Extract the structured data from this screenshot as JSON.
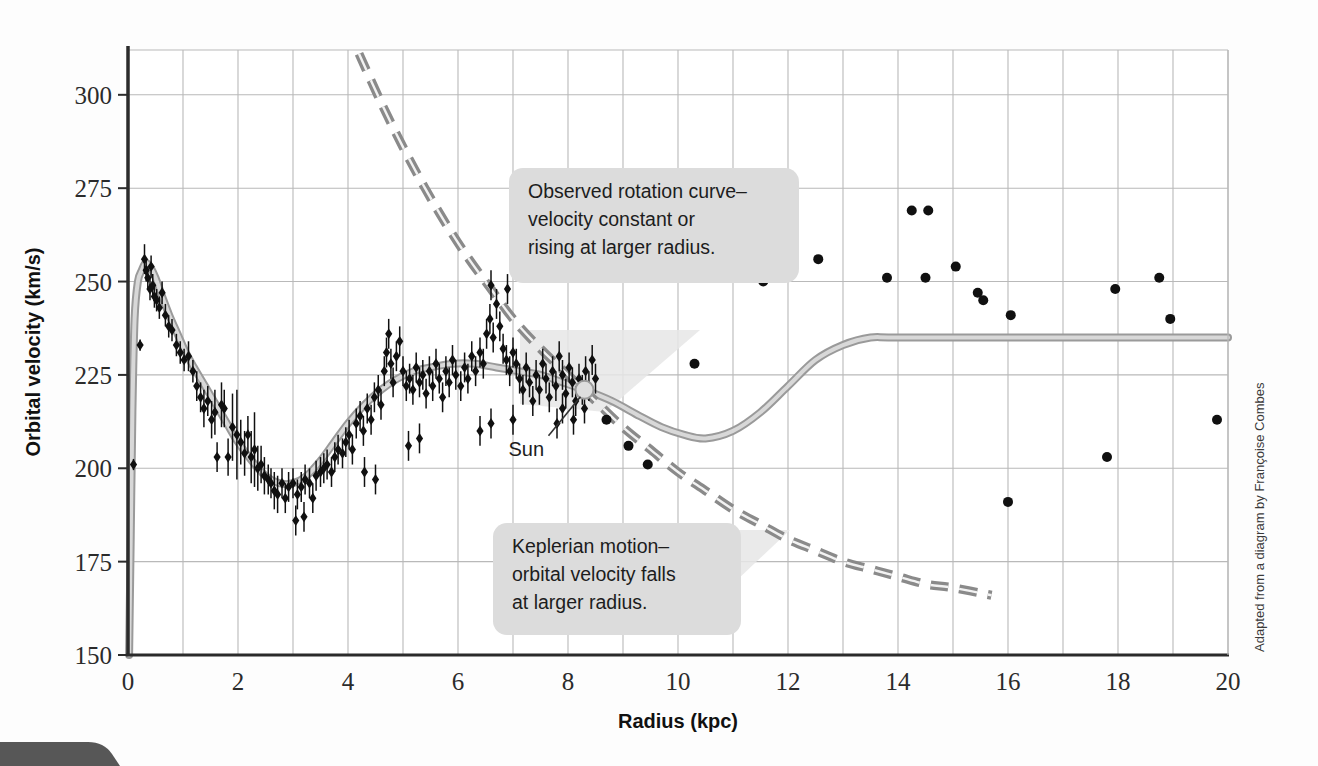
{
  "figure": {
    "credit": "Adapted from a diagram by Françoise Combes",
    "background_color": "#fdfdfd"
  },
  "colors": {
    "grid": "#b9b9b9",
    "axis": "#2b2b2b",
    "model_curve": "#9a9a9a",
    "model_curve_core": "#d8d8d8",
    "dashed_curve": "#8a8a8a",
    "data_point": "#101010",
    "callout_bg": "#dcdcdc",
    "callout_shadow": "#e3e3e3",
    "sun_marker": "#d9d9d9"
  },
  "annotations": {
    "observed": {
      "name": "observed-rotation-callout",
      "lines": [
        "Observed rotation curve–",
        "velocity constant or",
        "rising at larger radius."
      ]
    },
    "keplerian": {
      "name": "keplerian-callout",
      "lines": [
        "Keplerian motion–",
        "orbital velocity falls",
        "at larger radius."
      ]
    },
    "sun": {
      "label": "Sun",
      "radius_kpc": 8.3,
      "velocity_kms": 221
    }
  },
  "chart_data": {
    "type": "scatter",
    "title": "",
    "xlabel": "Radius (kpc)",
    "ylabel": "Orbital velocity (km/s)",
    "xlim": [
      0,
      20
    ],
    "ylim": [
      150,
      312
    ],
    "xticks": [
      0,
      2,
      4,
      6,
      8,
      10,
      12,
      14,
      16,
      18,
      20
    ],
    "yticks": [
      150,
      175,
      200,
      225,
      250,
      275,
      300
    ],
    "xtick_labels": [
      "0",
      "2",
      "4",
      "6",
      "8",
      "10",
      "12",
      "14",
      "16",
      "18",
      "20"
    ],
    "ytick_labels": [
      "150",
      "175",
      "200",
      "225",
      "250",
      "275",
      "300"
    ],
    "x_minor_step": 1,
    "grid": true,
    "legend": "none",
    "series": [
      {
        "name": "Model rotation curve (observed fit)",
        "type": "line",
        "style": "solid-gray-band",
        "points": [
          [
            0.02,
            150
          ],
          [
            0.05,
            182
          ],
          [
            0.08,
            215
          ],
          [
            0.12,
            240
          ],
          [
            0.18,
            250
          ],
          [
            0.25,
            253
          ],
          [
            0.32,
            255
          ],
          [
            0.4,
            254
          ],
          [
            0.5,
            251
          ],
          [
            0.62,
            246
          ],
          [
            0.75,
            241
          ],
          [
            0.9,
            236
          ],
          [
            1.05,
            231
          ],
          [
            1.2,
            227
          ],
          [
            1.4,
            222
          ],
          [
            1.6,
            217
          ],
          [
            1.8,
            212
          ],
          [
            2.0,
            207
          ],
          [
            2.25,
            202
          ],
          [
            2.5,
            198
          ],
          [
            2.75,
            196
          ],
          [
            3.0,
            196
          ],
          [
            3.25,
            198
          ],
          [
            3.5,
            202
          ],
          [
            3.75,
            207
          ],
          [
            4.0,
            212
          ],
          [
            4.3,
            217
          ],
          [
            4.6,
            221
          ],
          [
            4.9,
            224
          ],
          [
            5.2,
            226
          ],
          [
            5.5,
            227
          ],
          [
            5.9,
            228
          ],
          [
            6.3,
            228
          ],
          [
            6.7,
            227
          ],
          [
            7.1,
            226
          ],
          [
            7.5,
            225
          ],
          [
            7.9,
            223
          ],
          [
            8.3,
            221
          ],
          [
            8.8,
            218
          ],
          [
            9.3,
            214
          ],
          [
            9.7,
            211
          ],
          [
            10.1,
            209
          ],
          [
            10.5,
            208
          ],
          [
            11.0,
            210
          ],
          [
            11.5,
            215
          ],
          [
            12.0,
            222
          ],
          [
            12.5,
            229
          ],
          [
            13.0,
            233
          ],
          [
            13.5,
            235
          ],
          [
            14.0,
            235
          ],
          [
            16.0,
            235
          ],
          [
            18.0,
            235
          ],
          [
            20.0,
            235
          ]
        ]
      },
      {
        "name": "Keplerian prediction",
        "type": "line",
        "style": "dashed-gray",
        "points": [
          [
            4.2,
            311
          ],
          [
            4.6,
            298
          ],
          [
            5.0,
            286
          ],
          [
            5.4,
            275
          ],
          [
            5.8,
            265
          ],
          [
            6.2,
            256
          ],
          [
            6.6,
            248
          ],
          [
            7.0,
            240
          ],
          [
            7.5,
            232
          ],
          [
            8.0,
            225
          ],
          [
            8.5,
            218
          ],
          [
            9.0,
            211
          ],
          [
            9.5,
            205
          ],
          [
            10.0,
            199
          ],
          [
            10.5,
            194
          ],
          [
            11.0,
            189
          ],
          [
            11.5,
            185
          ],
          [
            12.0,
            181
          ],
          [
            12.5,
            178
          ],
          [
            13.0,
            175
          ],
          [
            13.5,
            173
          ],
          [
            14.0,
            171
          ],
          [
            14.5,
            169
          ],
          [
            15.0,
            168
          ],
          [
            15.7,
            166
          ]
        ]
      },
      {
        "name": "Inner disk measurements (with error bars)",
        "type": "scatter-errorbar",
        "marker": "diamond",
        "points": [
          [
            0.1,
            201,
            1.5
          ],
          [
            0.22,
            233,
            1.5
          ],
          [
            0.3,
            256,
            4
          ],
          [
            0.33,
            253,
            3
          ],
          [
            0.36,
            251,
            3
          ],
          [
            0.4,
            248,
            3
          ],
          [
            0.42,
            254,
            3
          ],
          [
            0.45,
            249,
            3
          ],
          [
            0.48,
            246,
            3
          ],
          [
            0.52,
            245,
            3
          ],
          [
            0.57,
            243,
            3
          ],
          [
            0.62,
            247,
            3
          ],
          [
            0.68,
            241,
            3
          ],
          [
            0.74,
            238,
            3
          ],
          [
            0.8,
            237,
            3
          ],
          [
            0.88,
            233,
            3
          ],
          [
            0.95,
            231,
            3
          ],
          [
            1.02,
            229,
            3
          ],
          [
            1.1,
            230,
            4
          ],
          [
            1.18,
            226,
            3
          ],
          [
            1.25,
            222,
            4
          ],
          [
            1.32,
            219,
            4
          ],
          [
            1.38,
            216,
            5
          ],
          [
            1.45,
            218,
            4
          ],
          [
            1.52,
            213,
            5
          ],
          [
            1.58,
            215,
            6
          ],
          [
            1.62,
            203,
            4
          ],
          [
            1.7,
            217,
            6
          ],
          [
            1.75,
            216,
            5
          ],
          [
            1.82,
            203,
            5
          ],
          [
            1.9,
            211,
            9
          ],
          [
            1.98,
            209,
            12
          ],
          [
            2.05,
            207,
            6
          ],
          [
            2.12,
            204,
            6
          ],
          [
            2.18,
            209,
            5
          ],
          [
            2.24,
            203,
            7
          ],
          [
            2.3,
            205,
            10
          ],
          [
            2.36,
            200,
            6
          ],
          [
            2.42,
            201,
            5
          ],
          [
            2.48,
            198,
            5
          ],
          [
            2.55,
            197,
            4
          ],
          [
            2.6,
            196,
            4
          ],
          [
            2.66,
            194,
            5
          ],
          [
            2.72,
            193,
            5
          ],
          [
            2.8,
            196,
            4
          ],
          [
            2.86,
            192,
            4
          ],
          [
            2.92,
            195,
            4
          ],
          [
            3.0,
            196,
            4
          ],
          [
            3.08,
            193,
            4
          ],
          [
            3.15,
            195,
            4
          ],
          [
            3.22,
            197,
            4
          ],
          [
            3.3,
            196,
            4
          ],
          [
            3.36,
            192,
            4
          ],
          [
            3.42,
            198,
            4
          ],
          [
            3.5,
            199,
            4
          ],
          [
            3.56,
            200,
            4
          ],
          [
            3.62,
            201,
            4
          ],
          [
            3.7,
            199,
            4
          ],
          [
            3.76,
            203,
            4
          ],
          [
            3.82,
            205,
            4
          ],
          [
            3.9,
            204,
            4
          ],
          [
            3.96,
            207,
            4
          ],
          [
            4.02,
            209,
            4
          ],
          [
            4.08,
            205,
            4
          ],
          [
            4.15,
            212,
            4
          ],
          [
            4.22,
            214,
            4
          ],
          [
            4.28,
            210,
            4
          ],
          [
            4.35,
            216,
            4
          ],
          [
            4.42,
            213,
            4
          ],
          [
            4.48,
            219,
            4
          ],
          [
            4.55,
            221,
            4
          ],
          [
            4.6,
            217,
            4
          ],
          [
            4.66,
            226,
            4
          ],
          [
            4.7,
            231,
            4
          ],
          [
            4.74,
            236,
            4
          ],
          [
            4.78,
            228,
            4
          ],
          [
            4.82,
            223,
            4
          ],
          [
            4.88,
            230,
            4
          ],
          [
            4.94,
            234,
            4
          ],
          [
            5.0,
            226,
            4
          ],
          [
            5.06,
            222,
            4
          ],
          [
            5.12,
            224,
            4
          ],
          [
            5.18,
            221,
            4
          ],
          [
            5.24,
            227,
            4
          ],
          [
            5.3,
            223,
            4
          ],
          [
            5.36,
            225,
            4
          ],
          [
            5.42,
            220,
            4
          ],
          [
            5.48,
            226,
            4
          ],
          [
            5.54,
            222,
            4
          ],
          [
            5.6,
            228,
            4
          ],
          [
            5.66,
            224,
            4
          ],
          [
            5.72,
            219,
            4
          ],
          [
            5.78,
            226,
            4
          ],
          [
            5.84,
            223,
            4
          ],
          [
            5.9,
            229,
            4
          ],
          [
            5.96,
            225,
            4
          ],
          [
            6.05,
            222,
            4
          ],
          [
            6.12,
            227,
            4
          ],
          [
            6.18,
            224,
            4
          ],
          [
            6.25,
            230,
            4
          ],
          [
            6.32,
            226,
            4
          ],
          [
            6.4,
            231,
            4
          ],
          [
            6.46,
            228,
            4
          ],
          [
            6.52,
            236,
            4
          ],
          [
            6.58,
            240,
            4
          ],
          [
            6.64,
            235,
            4
          ],
          [
            6.7,
            244,
            4
          ],
          [
            6.76,
            238,
            4
          ],
          [
            6.82,
            232,
            4
          ],
          [
            6.88,
            229,
            4
          ],
          [
            6.94,
            226,
            4
          ],
          [
            7.0,
            231,
            4
          ],
          [
            7.06,
            228,
            4
          ],
          [
            7.12,
            224,
            4
          ],
          [
            7.18,
            221,
            4
          ],
          [
            7.24,
            227,
            4
          ],
          [
            7.3,
            223,
            4
          ],
          [
            7.36,
            218,
            4
          ],
          [
            7.42,
            225,
            4
          ],
          [
            7.48,
            221,
            4
          ],
          [
            7.54,
            228,
            4
          ],
          [
            7.6,
            224,
            4
          ],
          [
            7.66,
            219,
            4
          ],
          [
            7.72,
            226,
            4
          ],
          [
            7.78,
            222,
            4
          ],
          [
            7.84,
            230,
            4
          ],
          [
            7.9,
            225,
            4
          ],
          [
            7.96,
            220,
            4
          ],
          [
            8.02,
            227,
            4
          ],
          [
            8.08,
            223,
            4
          ],
          [
            8.14,
            218,
            4
          ],
          [
            8.2,
            224,
            4
          ],
          [
            8.26,
            221,
            4
          ],
          [
            8.32,
            226,
            4
          ],
          [
            8.38,
            222,
            4
          ],
          [
            8.44,
            229,
            4
          ],
          [
            8.5,
            224,
            4
          ],
          [
            3.05,
            186,
            4
          ],
          [
            3.2,
            187,
            4
          ],
          [
            4.3,
            199,
            4
          ],
          [
            4.5,
            197,
            4
          ],
          [
            5.1,
            206,
            4
          ],
          [
            5.3,
            208,
            4
          ],
          [
            6.4,
            210,
            4
          ],
          [
            6.6,
            212,
            4
          ],
          [
            7.0,
            213,
            4
          ],
          [
            7.8,
            212,
            4
          ],
          [
            8.1,
            213,
            4
          ],
          [
            6.9,
            248,
            4
          ],
          [
            6.6,
            249,
            4
          ],
          [
            7.9,
            216,
            4
          ],
          [
            8.3,
            216,
            4
          ]
        ]
      },
      {
        "name": "Outer HI measurements",
        "type": "scatter",
        "marker": "circle",
        "points": [
          [
            8.7,
            213
          ],
          [
            9.1,
            206
          ],
          [
            9.45,
            201
          ],
          [
            10.3,
            228
          ],
          [
            11.55,
            250
          ],
          [
            12.55,
            256
          ],
          [
            13.8,
            251
          ],
          [
            14.25,
            269
          ],
          [
            14.55,
            269
          ],
          [
            14.5,
            251
          ],
          [
            15.05,
            254
          ],
          [
            15.45,
            247
          ],
          [
            15.55,
            245
          ],
          [
            16.0,
            191
          ],
          [
            16.05,
            241
          ],
          [
            17.8,
            203
          ],
          [
            17.95,
            248
          ],
          [
            18.75,
            251
          ],
          [
            18.95,
            240
          ],
          [
            19.8,
            213
          ]
        ]
      }
    ]
  }
}
